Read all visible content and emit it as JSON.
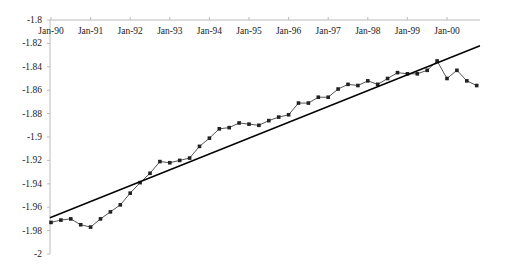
{
  "chart_data": {
    "type": "line",
    "title": "",
    "xlabel": "",
    "ylabel": "",
    "ylim": [
      -2,
      -1.8
    ],
    "y_ticks": [
      "-1.8",
      "-1.82",
      "-1.84",
      "-1.86",
      "-1.88",
      "-1.9",
      "-1.92",
      "-1.94",
      "-1.96",
      "-1.98",
      "-2"
    ],
    "x_ticks": [
      "Jan-90",
      "Jan-91",
      "Jan-92",
      "Jan-93",
      "Jan-94",
      "Jan-95",
      "Jan-96",
      "Jan-97",
      "Jan-98",
      "Jan-99",
      "Jan-00"
    ],
    "x_axis_position": "top",
    "grid": false,
    "legend": null,
    "series": [
      {
        "name": "actual",
        "style": "line-with-markers",
        "color": "#555555",
        "frequency": "quarterly",
        "start": "Jan-90",
        "values": [
          -1.973,
          -1.971,
          -1.97,
          -1.975,
          -1.977,
          -1.97,
          -1.964,
          -1.958,
          -1.948,
          -1.939,
          -1.931,
          -1.921,
          -1.922,
          -1.92,
          -1.918,
          -1.908,
          -1.901,
          -1.893,
          -1.892,
          -1.888,
          -1.889,
          -1.89,
          -1.886,
          -1.883,
          -1.881,
          -1.871,
          -1.871,
          -1.866,
          -1.866,
          -1.859,
          -1.855,
          -1.856,
          -1.852,
          -1.855,
          -1.85,
          -1.845,
          -1.846,
          -1.846,
          -1.843,
          -1.835,
          -1.85,
          -1.843,
          -1.852,
          -1.856
        ]
      },
      {
        "name": "trend",
        "style": "line",
        "color": "#000000",
        "start_value": -1.969,
        "end_value": -1.822
      }
    ]
  }
}
